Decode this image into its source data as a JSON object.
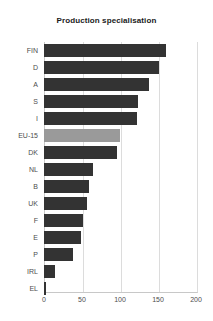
{
  "chart_data": {
    "type": "bar",
    "orientation": "horizontal",
    "title": "Production specialisation",
    "xlabel": "",
    "ylabel": "",
    "categories": [
      "FIN",
      "D",
      "A",
      "S",
      "I",
      "EU-15",
      "DK",
      "NL",
      "B",
      "UK",
      "F",
      "E",
      "P",
      "IRL",
      "EL"
    ],
    "values": [
      160,
      151,
      138,
      124,
      122,
      100,
      96,
      64,
      59,
      57,
      51,
      49,
      38,
      14,
      2
    ],
    "xlim": [
      0,
      200
    ],
    "xticks": [
      0,
      50,
      100,
      150,
      200
    ],
    "xtick_labels": [
      "0",
      "50",
      "100",
      "150",
      "200"
    ],
    "grid": "vertical",
    "legend": "none",
    "highlight_category": "EU-15",
    "colors": {
      "bar": "#333333",
      "bar_highlight": "#9a9a9a",
      "gridline": "#dcdcdc",
      "axis": "#c8c8c8",
      "text": "#4d4d4d",
      "title": "#1a1a1a",
      "background": "#ffffff"
    }
  }
}
